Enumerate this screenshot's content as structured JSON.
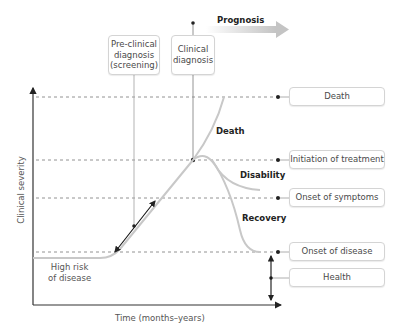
{
  "header": {
    "prognosis": "Prognosis",
    "preclinical_box": [
      "Pre-clinical",
      "diagnosis",
      "(screening)"
    ],
    "clinical_box": [
      "Clinical",
      "diagnosis"
    ]
  },
  "stage_labels": [
    {
      "id": "death",
      "label": "Death"
    },
    {
      "id": "initiation",
      "label": "Initiation of treatment"
    },
    {
      "id": "symptoms",
      "label": "Onset of symptoms"
    },
    {
      "id": "disease",
      "label": "Onset of disease"
    },
    {
      "id": "health",
      "label": "Health"
    }
  ],
  "outcomes": {
    "death": "Death",
    "disability": "Disability",
    "recovery": "Recovery"
  },
  "baseline_label": [
    "High risk",
    "of disease"
  ],
  "axes": {
    "x_label": "Time (months–years)",
    "y_label": "Clinical severity"
  },
  "colors": {
    "curve": "#c8c8c8",
    "axis": "#333333",
    "dash": "#777777",
    "arrow": "#d0d0d0"
  }
}
